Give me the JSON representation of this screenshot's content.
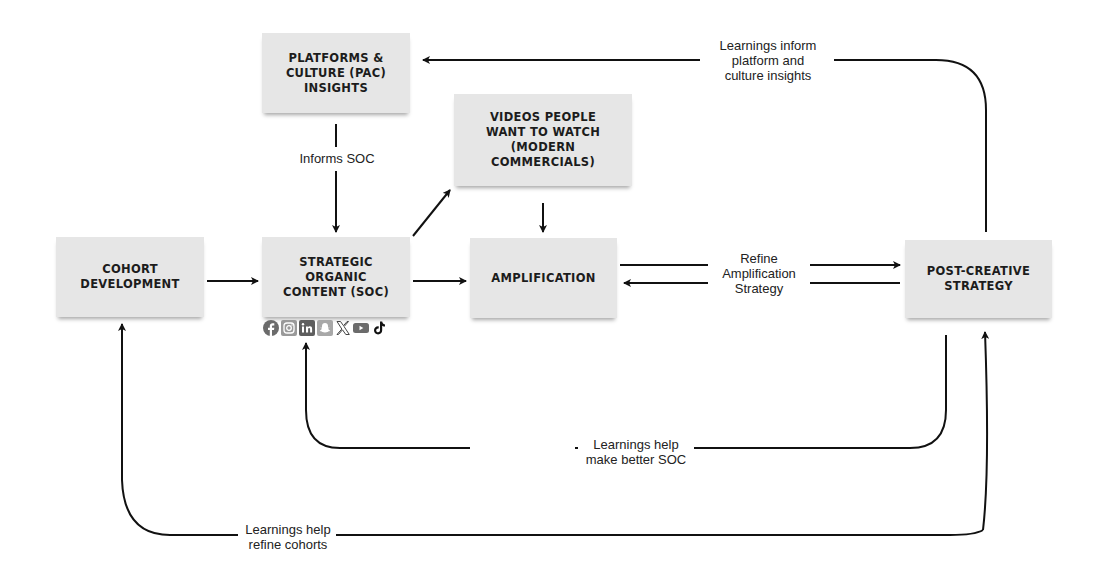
{
  "diagram": {
    "nodes": {
      "platforms": {
        "label": "PLATFORMS &\nCULTURE (PAC)\nINSIGHTS"
      },
      "videos": {
        "label": "VIDEOS PEOPLE\nWANT TO WATCH\n(MODERN\nCOMMERCIALS)"
      },
      "cohort": {
        "label": "COHORT\nDEVELOPMENT"
      },
      "soc": {
        "label": "STRATEGIC\nORGANIC\nCONTENT (SOC)"
      },
      "amplification": {
        "label": "AMPLIFICATION"
      },
      "post_creative": {
        "label": "POST-CREATIVE\nSTRATEGY"
      }
    },
    "edge_labels": {
      "informs_soc": "Informs SOC",
      "learnings_inform_platform": "Learnings inform\nplatform and\nculture insights",
      "refine_amplification": "Refine\nAmplification\nStrategy",
      "learnings_better_soc": "Learnings help\nmake better SOC",
      "learnings_refine_cohorts": "Learnings help\nrefine cohorts"
    },
    "social_icons": [
      "facebook-icon",
      "instagram-icon",
      "linkedin-icon",
      "snapchat-icon",
      "x-icon",
      "youtube-icon",
      "tiktok-icon"
    ],
    "colors": {
      "box_fill": "#e6e6e6",
      "line": "#111111",
      "text": "#1c1c1c",
      "icon_gray": "#6b6b6b"
    }
  }
}
